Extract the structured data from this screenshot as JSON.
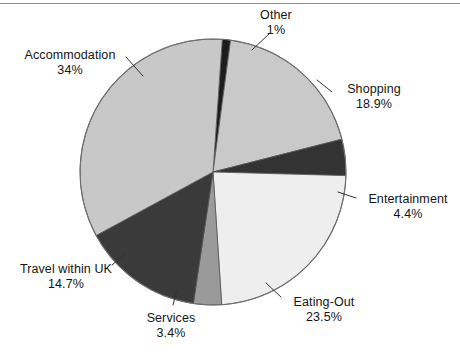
{
  "figure": {
    "background_color": "#ffffff",
    "rule_color": "#8c8c8c",
    "geometry": {
      "cx": 213,
      "cy": 172,
      "r": 133
    }
  },
  "chart_data": {
    "type": "pie",
    "title": "",
    "subtitle": "",
    "xlabel": "",
    "ylabel": "",
    "grid": false,
    "legend_position": "none",
    "labels_position": "outside-with-leader-lines",
    "units": "percent",
    "start_angle_deg": -86,
    "direction": "clockwise",
    "categories": [
      "Other",
      "Shopping",
      "Entertainment",
      "Eating-Out",
      "Services",
      "Travel within UK",
      "Accommodation"
    ],
    "values": [
      1,
      18.9,
      4.4,
      23.5,
      3.4,
      14.7,
      34
    ],
    "value_labels": [
      "1%",
      "18.9%",
      "4.4%",
      "23.5%",
      "3.4%",
      "14.7%",
      "34%"
    ],
    "colors": [
      "#1c1c1c",
      "#c9c9c9",
      "#333333",
      "#eeeeee",
      "#9a9a9a",
      "#3a3a3a",
      "#c8c8c8"
    ],
    "slice_edge_color": "#555555",
    "slices": [
      {
        "label": "Other",
        "value": 1,
        "value_label": "1%",
        "color": "#1c1c1c"
      },
      {
        "label": "Shopping",
        "value": 18.9,
        "value_label": "18.9%",
        "color": "#c9c9c9"
      },
      {
        "label": "Entertainment",
        "value": 4.4,
        "value_label": "4.4%",
        "color": "#333333"
      },
      {
        "label": "Eating-Out",
        "value": 23.5,
        "value_label": "23.5%",
        "color": "#eeeeee"
      },
      {
        "label": "Services",
        "value": 3.4,
        "value_label": "3.4%",
        "color": "#9a9a9a"
      },
      {
        "label": "Travel within UK",
        "value": 14.7,
        "value_label": "14.7%",
        "color": "#3a3a3a"
      },
      {
        "label": "Accommodation",
        "value": 34,
        "value_label": "34%",
        "color": "#c8c8c8"
      }
    ]
  },
  "labels": {
    "other": {
      "name": "Other",
      "pct": "1%"
    },
    "shopping": {
      "name": "Shopping",
      "pct": "18.9%"
    },
    "entertainment": {
      "name": "Entertainment",
      "pct": "4.4%"
    },
    "eatingout": {
      "name": "Eating-Out",
      "pct": "23.5%"
    },
    "services": {
      "name": "Services",
      "pct": "3.4%"
    },
    "travel": {
      "name": "Travel within UK",
      "pct": "14.7%"
    },
    "accommodation": {
      "name": "Accommodation",
      "pct": "34%"
    }
  }
}
